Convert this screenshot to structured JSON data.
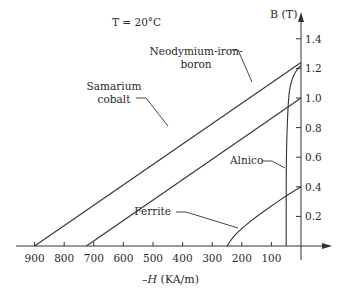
{
  "chart_data": {
    "type": "line",
    "title": "T = 20°C",
    "xlabel": "-H (KA/m)",
    "ylabel": "B (T)",
    "xlim": [
      1000,
      -150
    ],
    "ylim": [
      0,
      1.5
    ],
    "x_ticks": [
      900,
      800,
      700,
      600,
      500,
      400,
      300,
      200,
      100
    ],
    "x_tick_labels": [
      "900",
      "800",
      "700",
      "600",
      "500",
      "400",
      "300",
      "200",
      "100"
    ],
    "y_ticks": [
      0.2,
      0.4,
      0.6,
      0.8,
      1.0,
      1.2,
      1.4
    ],
    "y_tick_labels": [
      "0.2",
      "0.4",
      "0.6",
      "0.8",
      "1.0",
      "1.2",
      "1.4"
    ],
    "grid": false,
    "legend": "none (inline annotations)",
    "series": [
      {
        "name": "Neodymium-iron-boron",
        "label_lines": [
          "Neodymium-iron-",
          "boron"
        ],
        "shape": "straight",
        "points": [
          [
            900,
            0.0
          ],
          [
            0,
            1.24
          ]
        ]
      },
      {
        "name": "Samarium cobalt",
        "label_lines": [
          "Samarium",
          "cobalt"
        ],
        "shape": "straight",
        "points": [
          [
            725,
            0.0
          ],
          [
            0,
            1.0
          ]
        ]
      },
      {
        "name": "Alnico",
        "label_lines": [
          "Alnico"
        ],
        "shape": "curve",
        "points": [
          [
            50,
            0.0
          ],
          [
            50,
            0.6
          ],
          [
            45,
            0.9
          ],
          [
            40,
            1.05
          ],
          [
            30,
            1.13
          ],
          [
            15,
            1.19
          ],
          [
            0,
            1.22
          ]
        ]
      },
      {
        "name": "Ferrite",
        "label_lines": [
          "Ferrite"
        ],
        "shape": "curve",
        "points": [
          [
            250,
            0.0
          ],
          [
            230,
            0.06
          ],
          [
            200,
            0.12
          ],
          [
            150,
            0.2
          ],
          [
            100,
            0.27
          ],
          [
            50,
            0.34
          ],
          [
            0,
            0.4
          ]
        ]
      }
    ]
  }
}
